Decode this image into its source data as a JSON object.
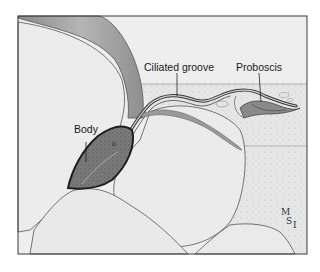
{
  "figure": {
    "labels": {
      "body": "Body",
      "ciliated_groove": "Ciliated groove",
      "proboscis": "Proboscis"
    },
    "signature": {
      "m": "M",
      "s": "S",
      "i": "I"
    },
    "colors": {
      "frame": "#3a3a3a",
      "grain_fill": "#ececec",
      "sediment_fill": "#e4e4e4",
      "body_fill": "#6e6e6e",
      "background": "#ffffff"
    }
  }
}
